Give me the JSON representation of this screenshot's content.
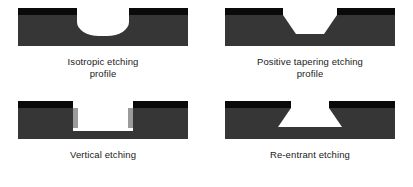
{
  "figure": {
    "colors": {
      "background": "#ffffff",
      "mask": "#0a0a0a",
      "substrate": "#363636",
      "cavity": "#ffffff",
      "sidewall_passivation": "#9b9b9b",
      "caption_text": "#1a1a1a"
    },
    "panels": [
      {
        "id": "isotropic",
        "profile_type": "isotropic",
        "caption_line1": "Isotropic etching",
        "caption_line2": "profile",
        "description": "Curved undercut extending beneath the mask on both sides",
        "has_sidewall_passivation": false
      },
      {
        "id": "positive-tapering",
        "profile_type": "positive-taper",
        "caption_line1": "Positive tapering etching",
        "caption_line2": "profile",
        "description": "Trapezoidal cavity narrowing toward the bottom",
        "has_sidewall_passivation": false
      },
      {
        "id": "vertical",
        "profile_type": "vertical",
        "caption_line1": "Vertical etching",
        "caption_line2": "",
        "description": "Straight vertical sidewalls with grey passivation layers",
        "has_sidewall_passivation": true
      },
      {
        "id": "re-entrant",
        "profile_type": "re-entrant",
        "caption_line1": "Re-entrant etching",
        "caption_line2": "",
        "description": "Inverted trapezoidal cavity widening toward the bottom",
        "has_sidewall_passivation": false
      }
    ]
  }
}
